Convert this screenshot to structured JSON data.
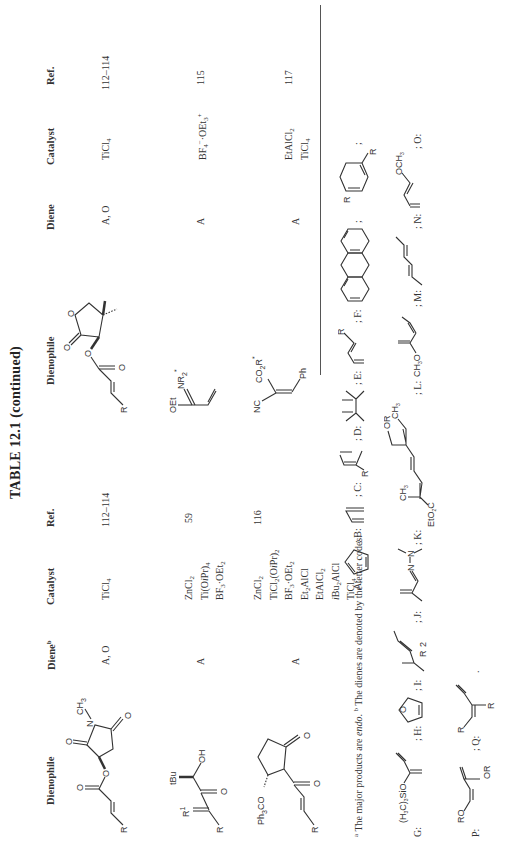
{
  "table": {
    "title": "TABLE 12.1 (continued)",
    "left_columns": [
      "Dienophile",
      "Diene",
      "Catalyst",
      "Ref."
    ],
    "left_diene_header_footnote": "b",
    "right_columns": [
      "Dienophile",
      "Diene",
      "Catalyst",
      "Ref."
    ],
    "left_rows": [
      {
        "dienophile": "(S)-N-methylsuccinimid-3-yl acrylate (R-CH=CH-CO2-)",
        "dienophile_labels": [
          "R",
          "O",
          "O",
          "O",
          "N",
          "CH3",
          "O"
        ],
        "diene": "A, O",
        "catalyst": [
          "TiCl4"
        ],
        "ref": "112–114"
      },
      {
        "dienophile": "R-CH=C(R1)-CO-CH(tBu)-OH",
        "dienophile_labels": [
          "R",
          "R1",
          "tBu",
          "OH",
          "O"
        ],
        "diene": "A",
        "catalyst": [
          "ZnCl2",
          "Ti(OiPr)4",
          "BF3·OEt2"
        ],
        "ref": "59"
      },
      {
        "dienophile": "2-acryloyl-3-(trityloxy)cyclopentanone",
        "dienophile_labels": [
          "Ph3CO",
          "O",
          "O",
          "R"
        ],
        "diene": "A",
        "catalyst": [
          "ZnCl2",
          "TiCl2(OiPr)2",
          "BF3·OEt2",
          "Et2AlCl",
          "EtAlCl2",
          "iBu2AlCl",
          "TiCl4"
        ],
        "ref": "116"
      }
    ],
    "right_rows": [
      {
        "dienophile": "pantolactone acrylate (R-CH=CH-CO2-)",
        "dienophile_labels": [
          "R",
          "O",
          "O",
          "O",
          "O"
        ],
        "diene": "A, O",
        "catalyst": [
          "TiCl4"
        ],
        "ref": "112–114"
      },
      {
        "dienophile": "CH2=CH-C(OEt)=NR2*",
        "dienophile_labels": [
          "OEt",
          "NR2*"
        ],
        "diene": "A",
        "catalyst": [
          "BF4⁻·OEt3⁺"
        ],
        "ref": "115"
      },
      {
        "dienophile": "NC-C(CO2R*)=CH-Ph",
        "dienophile_labels": [
          "NC",
          "CO2R*",
          "Ph"
        ],
        "diene": "A",
        "catalyst": [
          "EtAlCl2",
          "TiCl4"
        ],
        "ref": "117"
      }
    ]
  },
  "footnotes": {
    "a": "The major products are endo.",
    "b": "The dienes are denoted by the letter codes:",
    "codes": [
      {
        "code": "A",
        "name": "cyclopentadiene"
      },
      {
        "code": "B",
        "name": "1,3-butadiene"
      },
      {
        "code": "C",
        "name": "2-substituted butadiene",
        "label": "R"
      },
      {
        "code": "D",
        "name": "2,3-dimethylbutadiene"
      },
      {
        "code": "E",
        "name": "1-substituted butadiene",
        "label": "R"
      },
      {
        "code": "F",
        "name": "anthracene"
      },
      {
        "code": "G",
        "name": "2-trimethylsilyloxybutadiene",
        "label": "(H3C)3SiO"
      },
      {
        "code": "H",
        "name": "furan",
        "label": "O"
      },
      {
        "code": "I",
        "name": "substituted methylpentadiene",
        "label": "R"
      },
      {
        "code": "J",
        "name": "1-dimethylamino-aza-diene",
        "label": "N–N"
      },
      {
        "code": "K",
        "name": "trienoate",
        "labels": [
          "OR",
          "CH3",
          "EtO2C",
          "CH3"
        ]
      },
      {
        "code": "L",
        "name": "2-methoxy... diene",
        "label": "CH3O"
      },
      {
        "code": "M",
        "name": "2,4-hexadiene"
      },
      {
        "code": "N",
        "name": "1-methoxybutadiene",
        "label": "OCH3"
      },
      {
        "code": "O",
        "name": "1,3-disubstituted cyclohexadiene",
        "label": "R"
      },
      {
        "code": "P",
        "name": "1-alkoxy-3-alkoxy butadiene",
        "labels": [
          "RO",
          "OR"
        ]
      },
      {
        "code": "Q",
        "name": "1,2-disubstituted diene",
        "labels": [
          "R",
          "R"
        ]
      }
    ]
  },
  "labels": {
    "A": "A",
    "B": "B",
    "C": "C",
    "D": "D",
    "E": "E",
    "F": "F",
    "G": "G",
    "H": "H",
    "I": "I",
    "J": "J",
    "K": "K",
    "L": "L",
    "M": "M",
    "N": "N",
    "O": "O",
    "P": "P",
    "Q": "Q"
  }
}
